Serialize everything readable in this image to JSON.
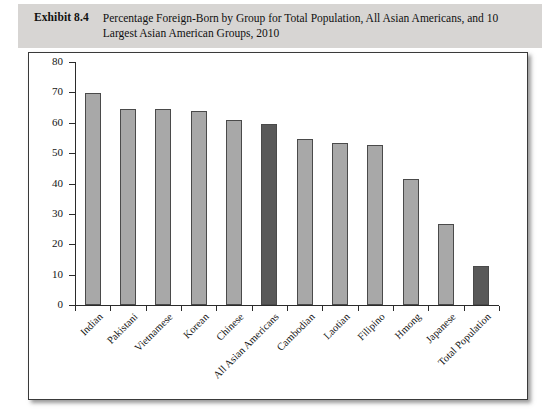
{
  "caption": {
    "label": "Exhibit 8.4",
    "text": "Percentage Foreign-Born by Group for Total Population, All Asian Americans, and 10 Largest Asian American Groups, 2010"
  },
  "colors": {
    "caption_band": "#d7d5d3",
    "bar_light": "#a8a8a8",
    "bar_dark": "#595959",
    "bar_edge": "#4a4a4a",
    "axis": "#2b2b2b",
    "frame": "#3a3a3a",
    "plot_background": "#ffffff"
  },
  "chart_data": {
    "type": "bar",
    "title": "Percentage Foreign-Born by Group for Total Population, All Asian Americans, and 10 Largest Asian American Groups, 2010",
    "xlabel": "",
    "ylabel": "",
    "ylim": [
      0,
      80
    ],
    "yticks": [
      0,
      10,
      20,
      30,
      40,
      50,
      60,
      70,
      80
    ],
    "ytick_labels": [
      "0",
      "10",
      "20",
      "30",
      "40",
      "50",
      "60",
      "70",
      "80"
    ],
    "grid": false,
    "legend": "none",
    "categories": [
      "Indian",
      "Pakistani",
      "Vietnamese",
      "Korean",
      "Chinese",
      "All Asian Americans",
      "Cambodian",
      "Laotian",
      "Filipino",
      "Hmong",
      "Japanese",
      "Total Population"
    ],
    "values": [
      69.7,
      64.6,
      64.6,
      63.9,
      61.0,
      59.6,
      54.8,
      53.5,
      52.6,
      41.6,
      26.8,
      12.7
    ],
    "bar_colors": [
      "#a8a8a8",
      "#a8a8a8",
      "#a8a8a8",
      "#a8a8a8",
      "#a8a8a8",
      "#595959",
      "#a8a8a8",
      "#a8a8a8",
      "#a8a8a8",
      "#a8a8a8",
      "#a8a8a8",
      "#595959"
    ]
  }
}
